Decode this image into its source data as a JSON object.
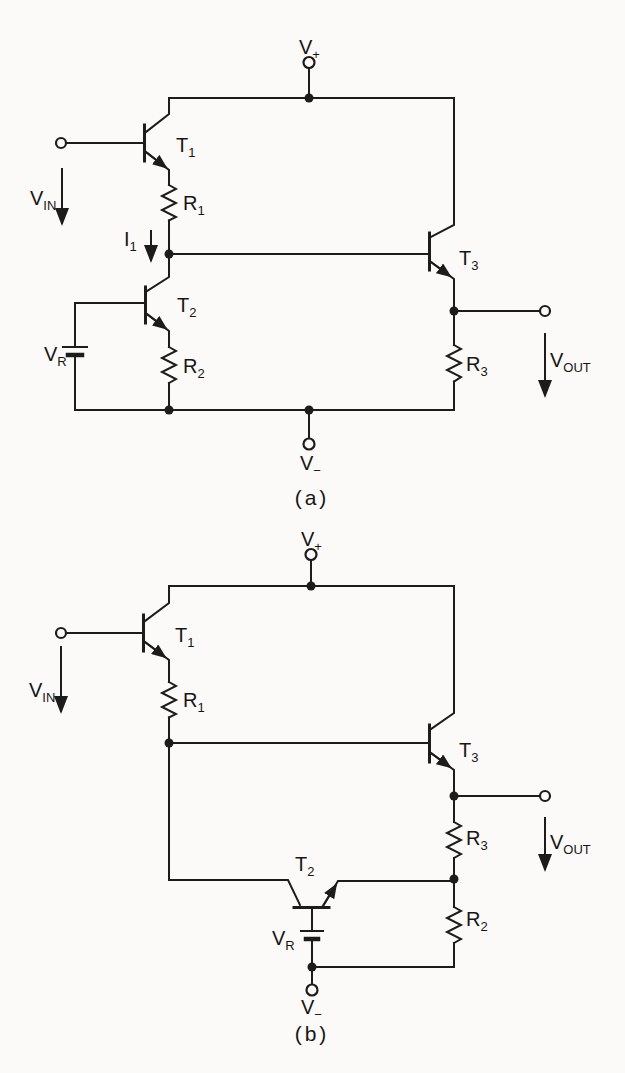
{
  "figure": {
    "type": "circuit-schematic",
    "background": "#fbfaf8",
    "ink": "#1d1c1a",
    "circuits": {
      "a": {
        "caption": "(a)",
        "labels": {
          "v_plus": {
            "main": "V",
            "sub": "+"
          },
          "v_minus": {
            "main": "V",
            "sub": "−"
          },
          "v_in": {
            "main": "V",
            "sub": "IN"
          },
          "v_out": {
            "main": "V",
            "sub": "OUT"
          },
          "v_r": {
            "main": "V",
            "sub": "R"
          },
          "i_1": {
            "main": "I",
            "sub": "1"
          },
          "t_1": {
            "main": "T",
            "sub": "1"
          },
          "t_2": {
            "main": "T",
            "sub": "2"
          },
          "t_3": {
            "main": "T",
            "sub": "3"
          },
          "r_1": {
            "main": "R",
            "sub": "1"
          },
          "r_2": {
            "main": "R",
            "sub": "2"
          },
          "r_3": {
            "main": "R",
            "sub": "3"
          }
        }
      },
      "b": {
        "caption": "(b)",
        "labels": {
          "v_plus": {
            "main": "V",
            "sub": "+"
          },
          "v_minus": {
            "main": "V",
            "sub": "−"
          },
          "v_in": {
            "main": "V",
            "sub": "IN"
          },
          "v_out": {
            "main": "V",
            "sub": "OUT"
          },
          "v_r": {
            "main": "V",
            "sub": "R"
          },
          "t_1": {
            "main": "T",
            "sub": "1"
          },
          "t_2": {
            "main": "T",
            "sub": "2"
          },
          "t_3": {
            "main": "T",
            "sub": "3"
          },
          "r_1": {
            "main": "R",
            "sub": "1"
          },
          "r_2": {
            "main": "R",
            "sub": "2"
          },
          "r_3": {
            "main": "R",
            "sub": "3"
          }
        }
      }
    }
  }
}
